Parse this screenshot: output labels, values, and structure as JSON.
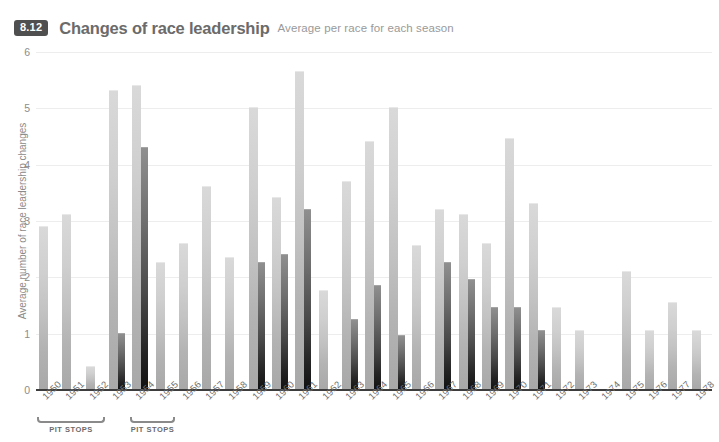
{
  "header": {
    "badge": "8.12",
    "title": "Changes of race leadership",
    "subtitle": "Average per race for each season"
  },
  "chart_data": {
    "type": "bar",
    "title": "Changes of race leadership",
    "subtitle": "Average per race for each season",
    "xlabel": "",
    "ylabel": "Average number of race leadership changes",
    "ylim": [
      0,
      6
    ],
    "yticks": [
      "0",
      "1",
      "2",
      "3",
      "4",
      "5",
      "6"
    ],
    "grid": true,
    "legend": "none",
    "categories": [
      "1950",
      "1951",
      "1952",
      "1953",
      "1954",
      "1955",
      "1956",
      "1957",
      "1958",
      "1959",
      "1960",
      "1961",
      "1962",
      "1963",
      "1964",
      "1965",
      "1966",
      "1967",
      "1968",
      "1969",
      "1970",
      "1971",
      "1972",
      "1973",
      "1974",
      "1975",
      "1976",
      "1977",
      "1978"
    ],
    "series": [
      {
        "name": "Average leadership changes",
        "color": "#c2c2c2",
        "values": [
          2.9,
          3.1,
          0.4,
          5.3,
          5.4,
          2.25,
          2.6,
          3.6,
          2.35,
          5.0,
          3.4,
          5.65,
          1.75,
          3.7,
          4.4,
          5.0,
          2.55,
          3.2,
          3.1,
          2.6,
          4.45,
          3.3,
          1.45,
          1.05,
          0.0,
          2.1,
          1.05,
          1.55,
          1.05
        ]
      },
      {
        "name": "Overlay (dark)",
        "color": "#333333",
        "values": [
          null,
          null,
          null,
          1.0,
          4.3,
          null,
          null,
          null,
          null,
          2.25,
          2.4,
          3.2,
          null,
          1.25,
          1.85,
          0.95,
          null,
          2.25,
          1.95,
          1.45,
          1.45,
          1.05,
          null,
          null,
          null,
          null,
          null,
          null,
          null
        ]
      }
    ],
    "annotations": [
      {
        "label": "PIT STOPS",
        "from": "1950",
        "to": "1952"
      },
      {
        "label": "PIT STOPS",
        "from": "1954",
        "to": "1955"
      }
    ]
  }
}
